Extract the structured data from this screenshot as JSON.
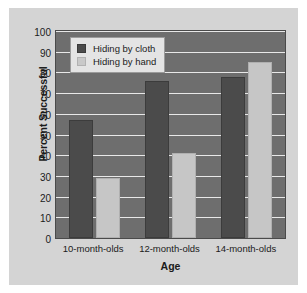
{
  "chart_data": {
    "type": "bar",
    "title": "",
    "xlabel": "Age",
    "ylabel": "Percent Successful",
    "categories": [
      "10-month-olds",
      "12-month-olds",
      "14-month-olds"
    ],
    "series": [
      {
        "name": "Hiding by cloth",
        "values": [
          57,
          76,
          78
        ],
        "color": "#4b4b4b"
      },
      {
        "name": "Hiding by hand",
        "values": [
          29,
          41,
          85
        ],
        "color": "#c6c6c6"
      }
    ],
    "ylim": [
      0,
      100
    ],
    "yticks": [
      100,
      90,
      80,
      70,
      60,
      50,
      40,
      30,
      20,
      10,
      0
    ],
    "grid": true,
    "legend_position": "top-left",
    "plot_background": "#6e6e6e",
    "gridline_color": "#e8e8e8",
    "figure_background": "#d4d4d4"
  }
}
